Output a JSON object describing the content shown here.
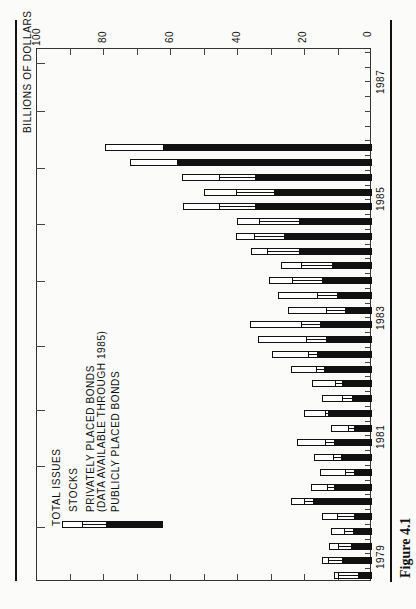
{
  "figure": {
    "caption": "Figure 4.1",
    "axis_title": "BILLIONS OF DOLLARS",
    "value_ticks": [
      "100",
      "80",
      "60",
      "40",
      "20",
      "0"
    ],
    "year_labels": [
      "1979",
      "1981",
      "1983",
      "1985",
      "1987"
    ],
    "legend": {
      "total": "TOTAL ISSUES",
      "stocks": "STOCKS",
      "private_line1": "PRIVATELY PLACED BONDS",
      "private_line2": "(DATA AVAILABLE THROUGH 1985)",
      "public": "PUBLICLY PLACED BONDS"
    }
  },
  "colors": {
    "ink": "#111111",
    "paper": "#fbfbf9",
    "stocks_fill": "#ffffff",
    "private_fill": "#ffffff",
    "public_fill": "#111111"
  },
  "chart_data": {
    "type": "bar",
    "orientation": "stacked, rotated 90° (time runs bottom-to-top, values increase right-to-left)",
    "title": "",
    "caption": "Figure 4.1",
    "xlabel": "Quarter",
    "ylabel": "BILLIONS OF DOLLARS",
    "ylim": [
      0,
      100
    ],
    "value_ticks": [
      0,
      20,
      40,
      60,
      80,
      100
    ],
    "year_tick_labels": [
      "1979",
      "1981",
      "1983",
      "1985",
      "1987"
    ],
    "legend_position": "lower-left (inside plot)",
    "grid": false,
    "categories": [
      "1979Q1",
      "1979Q2",
      "1979Q3",
      "1979Q4",
      "1980Q1",
      "1980Q2",
      "1980Q3",
      "1980Q4",
      "1981Q1",
      "1981Q2",
      "1981Q3",
      "1981Q4",
      "1982Q1",
      "1982Q2",
      "1982Q3",
      "1982Q4",
      "1983Q1",
      "1983Q2",
      "1983Q3",
      "1983Q4",
      "1984Q1",
      "1984Q2",
      "1984Q3",
      "1984Q4",
      "1985Q1",
      "1985Q2",
      "1985Q3",
      "1985Q4",
      "1986Q1",
      "1986Q2"
    ],
    "series": [
      {
        "name": "PUBLICLY PLACED BONDS",
        "values": [
          3.8,
          8.7,
          6.0,
          5.4,
          5.1,
          17.4,
          11.1,
          5.1,
          9.0,
          11.0,
          5.1,
          12.9,
          5.7,
          8.7,
          14.0,
          16.0,
          13.5,
          15.3,
          7.8,
          10.2,
          14.7,
          11.7,
          21.6,
          26.0,
          21.6,
          34.5,
          29.0,
          34.5,
          58.0,
          62.0
        ]
      },
      {
        "name": "PRIVATELY PLACED BONDS (DATA AVAILABLE THROUGH 1985)",
        "values": [
          6.0,
          4.2,
          3.9,
          2.7,
          5.1,
          2.7,
          2.1,
          2.7,
          2.4,
          2.7,
          1.8,
          0.9,
          3.0,
          2.1,
          2.4,
          2.7,
          6.0,
          5.7,
          5.7,
          6.0,
          9.0,
          9.3,
          9.3,
          9.0,
          11.7,
          11.0,
          11.4,
          11.0,
          0,
          0
        ]
      },
      {
        "name": "STOCKS",
        "values": [
          1.2,
          1.8,
          2.7,
          3.9,
          4.5,
          3.9,
          4.8,
          7.5,
          5.7,
          8.4,
          5.1,
          6.3,
          6.0,
          6.9,
          7.5,
          10.8,
          14.1,
          15.0,
          11.4,
          11.7,
          6.6,
          6.0,
          4.8,
          5.4,
          6.6,
          10.5,
          9.6,
          11.0,
          13.8,
          17.3
        ]
      }
    ],
    "totals": [
      11.0,
      14.7,
      12.6,
      12.0,
      14.7,
      24.0,
      18.0,
      15.3,
      17.1,
      22.1,
      12.0,
      20.1,
      14.7,
      17.7,
      23.9,
      29.5,
      33.6,
      36.0,
      24.9,
      27.9,
      30.3,
      27.0,
      35.7,
      40.4,
      39.9,
      56.0,
      50.0,
      56.5,
      71.8,
      79.3
    ]
  }
}
